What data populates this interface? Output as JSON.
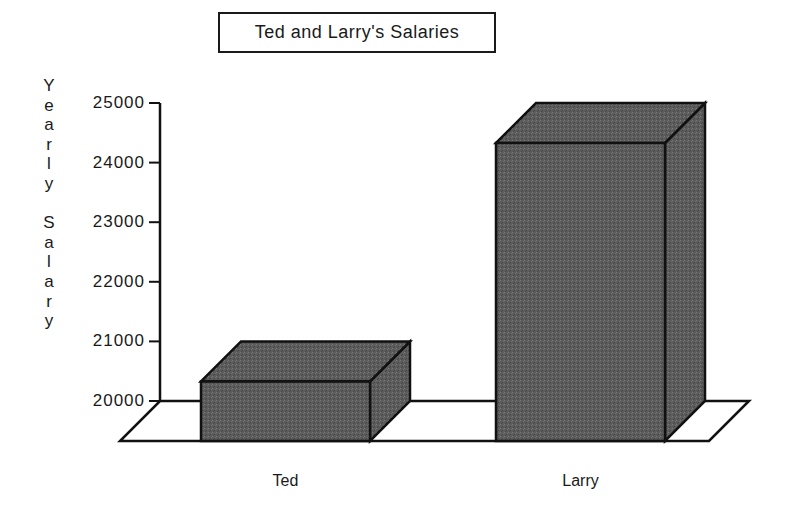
{
  "chart_data": {
    "type": "bar",
    "style": "3d",
    "title": "Ted and Larry's Salaries",
    "xlabel": "",
    "ylabel": "Yearly Salary",
    "categories": [
      "Ted",
      "Larry"
    ],
    "values": [
      21000,
      25000
    ],
    "ylim": [
      20000,
      25000
    ],
    "yticks": [
      25000,
      24000,
      23000,
      22000,
      21000,
      20000
    ],
    "grid": false,
    "legend": null,
    "colors": {
      "bar_fill": "#5a5a5a",
      "bar_top": "#6a6a6a",
      "bar_side": "#4e4e4e",
      "outline": "#111111",
      "floor": "#ffffff"
    }
  },
  "title": "Ted and Larry's Salaries",
  "y_axis": {
    "label_letters": [
      "Y",
      "e",
      "a",
      "r",
      "l",
      "y",
      " ",
      "S",
      "a",
      "l",
      "a",
      "r",
      "y"
    ],
    "ticks": [
      "25000",
      "24000",
      "23000",
      "22000",
      "21000",
      "20000"
    ]
  },
  "x_axis": {
    "labels": [
      "Ted",
      "Larry"
    ]
  }
}
